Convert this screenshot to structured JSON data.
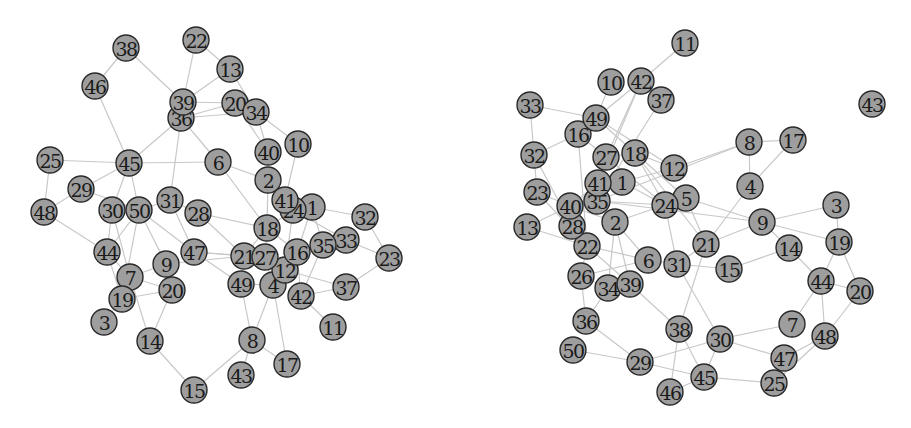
{
  "graphs": [
    {
      "id": "left-graph",
      "nodes": [
        "1",
        "2",
        "3",
        "4",
        "6",
        "7",
        "8",
        "9",
        "10",
        "11",
        "12",
        "13",
        "14",
        "15",
        "16",
        "17",
        "18",
        "19",
        "20",
        "21",
        "22",
        "23",
        "24",
        "25",
        "26",
        "27",
        "28",
        "29",
        "30",
        "31",
        "32",
        "33",
        "34",
        "35",
        "36",
        "37",
        "38",
        "39",
        "40",
        "41",
        "42",
        "43",
        "44",
        "45",
        "46",
        "47",
        "48",
        "49",
        "50"
      ],
      "edges": [
        [
          "38",
          "46"
        ],
        [
          "38",
          "39"
        ],
        [
          "46",
          "45"
        ],
        [
          "22",
          "39"
        ],
        [
          "22",
          "13"
        ],
        [
          "13",
          "39"
        ],
        [
          "13",
          "34"
        ],
        [
          "39",
          "20"
        ],
        [
          "36",
          "20"
        ],
        [
          "36",
          "34"
        ],
        [
          "36",
          "45"
        ],
        [
          "36",
          "6"
        ],
        [
          "36",
          "31"
        ],
        [
          "20",
          "40"
        ],
        [
          "34",
          "10"
        ],
        [
          "34",
          "40"
        ],
        [
          "40",
          "2"
        ],
        [
          "10",
          "41"
        ],
        [
          "6",
          "45"
        ],
        [
          "6",
          "2"
        ],
        [
          "6",
          "18"
        ],
        [
          "25",
          "45"
        ],
        [
          "25",
          "48"
        ],
        [
          "45",
          "29"
        ],
        [
          "45",
          "30"
        ],
        [
          "45",
          "50"
        ],
        [
          "29",
          "48"
        ],
        [
          "29",
          "50"
        ],
        [
          "48",
          "44"
        ],
        [
          "30",
          "44"
        ],
        [
          "30",
          "7"
        ],
        [
          "50",
          "44"
        ],
        [
          "50",
          "9"
        ],
        [
          "50",
          "47"
        ],
        [
          "50",
          "31"
        ],
        [
          "31",
          "28"
        ],
        [
          "31",
          "47"
        ],
        [
          "28",
          "18"
        ],
        [
          "28",
          "21"
        ],
        [
          "47",
          "21"
        ],
        [
          "47",
          "49"
        ],
        [
          "47",
          "27"
        ],
        [
          "44",
          "7"
        ],
        [
          "44",
          "19"
        ],
        [
          "7",
          "9"
        ],
        [
          "7",
          "20"
        ],
        [
          "7",
          "14"
        ],
        [
          "9",
          "20"
        ],
        [
          "9",
          "21"
        ],
        [
          "19",
          "3"
        ],
        [
          "19",
          "20"
        ],
        [
          "20",
          "14"
        ],
        [
          "14",
          "15"
        ],
        [
          "15",
          "8"
        ],
        [
          "2",
          "41"
        ],
        [
          "2",
          "18"
        ],
        [
          "41",
          "1"
        ],
        [
          "41",
          "24"
        ],
        [
          "1",
          "16"
        ],
        [
          "1",
          "35"
        ],
        [
          "1",
          "32"
        ],
        [
          "24",
          "18"
        ],
        [
          "24",
          "33"
        ],
        [
          "18",
          "21"
        ],
        [
          "18",
          "27"
        ],
        [
          "18",
          "16"
        ],
        [
          "27",
          "12"
        ],
        [
          "27",
          "4"
        ],
        [
          "21",
          "49"
        ],
        [
          "16",
          "12"
        ],
        [
          "16",
          "42"
        ],
        [
          "35",
          "33"
        ],
        [
          "35",
          "42"
        ],
        [
          "33",
          "23"
        ],
        [
          "32",
          "23"
        ],
        [
          "23",
          "37"
        ],
        [
          "37",
          "42"
        ],
        [
          "37",
          "12"
        ],
        [
          "12",
          "4"
        ],
        [
          "42",
          "11"
        ],
        [
          "4",
          "49"
        ],
        [
          "4",
          "8"
        ],
        [
          "4",
          "17"
        ],
        [
          "49",
          "8"
        ],
        [
          "8",
          "43"
        ],
        [
          "8",
          "17"
        ],
        [
          "24",
          "12"
        ],
        [
          "19",
          "50"
        ]
      ]
    },
    {
      "id": "right-graph",
      "nodes": [
        "1",
        "2",
        "3",
        "4",
        "5",
        "6",
        "7",
        "8",
        "9",
        "10",
        "11",
        "12",
        "13",
        "14",
        "15",
        "16",
        "17",
        "18",
        "19",
        "20",
        "21",
        "22",
        "23",
        "24",
        "25",
        "26",
        "27",
        "28",
        "29",
        "30",
        "31",
        "32",
        "33",
        "34",
        "35",
        "36",
        "37",
        "38",
        "39",
        "40",
        "41",
        "42",
        "43",
        "44",
        "45",
        "46",
        "47",
        "48",
        "49",
        "50"
      ],
      "edges": [
        [
          "11",
          "42"
        ],
        [
          "10",
          "49"
        ],
        [
          "42",
          "37"
        ],
        [
          "42",
          "49"
        ],
        [
          "42",
          "27"
        ],
        [
          "42",
          "41"
        ],
        [
          "37",
          "35"
        ],
        [
          "33",
          "49"
        ],
        [
          "33",
          "32"
        ],
        [
          "49",
          "16"
        ],
        [
          "49",
          "18"
        ],
        [
          "49",
          "12"
        ],
        [
          "16",
          "32"
        ],
        [
          "16",
          "27"
        ],
        [
          "16",
          "22"
        ],
        [
          "32",
          "23"
        ],
        [
          "32",
          "28"
        ],
        [
          "27",
          "18"
        ],
        [
          "27",
          "41"
        ],
        [
          "27",
          "24"
        ],
        [
          "18",
          "12"
        ],
        [
          "18",
          "24"
        ],
        [
          "18",
          "5"
        ],
        [
          "18",
          "21"
        ],
        [
          "12",
          "8"
        ],
        [
          "12",
          "1"
        ],
        [
          "8",
          "17"
        ],
        [
          "8",
          "4"
        ],
        [
          "17",
          "4"
        ],
        [
          "8",
          "35"
        ],
        [
          "4",
          "21"
        ],
        [
          "41",
          "1"
        ],
        [
          "41",
          "35"
        ],
        [
          "41",
          "40"
        ],
        [
          "1",
          "24"
        ],
        [
          "23",
          "40"
        ],
        [
          "23",
          "22"
        ],
        [
          "13",
          "40"
        ],
        [
          "13",
          "22"
        ],
        [
          "40",
          "28"
        ],
        [
          "40",
          "2"
        ],
        [
          "35",
          "24"
        ],
        [
          "35",
          "9"
        ],
        [
          "2",
          "24"
        ],
        [
          "2",
          "6"
        ],
        [
          "2",
          "34"
        ],
        [
          "2",
          "39"
        ],
        [
          "28",
          "22"
        ],
        [
          "22",
          "6"
        ],
        [
          "22",
          "26"
        ],
        [
          "22",
          "39"
        ],
        [
          "24",
          "31"
        ],
        [
          "24",
          "5"
        ],
        [
          "5",
          "9"
        ],
        [
          "5",
          "21"
        ],
        [
          "6",
          "31"
        ],
        [
          "6",
          "26"
        ],
        [
          "31",
          "21"
        ],
        [
          "31",
          "15"
        ],
        [
          "31",
          "30"
        ],
        [
          "21",
          "9"
        ],
        [
          "21",
          "38"
        ],
        [
          "9",
          "3"
        ],
        [
          "9",
          "14"
        ],
        [
          "9",
          "19"
        ],
        [
          "3",
          "19"
        ],
        [
          "14",
          "15"
        ],
        [
          "14",
          "44"
        ],
        [
          "19",
          "44"
        ],
        [
          "19",
          "20"
        ],
        [
          "44",
          "20"
        ],
        [
          "44",
          "7"
        ],
        [
          "44",
          "48"
        ],
        [
          "20",
          "48"
        ],
        [
          "48",
          "47"
        ],
        [
          "48",
          "25"
        ],
        [
          "7",
          "30"
        ],
        [
          "30",
          "47"
        ],
        [
          "30",
          "45"
        ],
        [
          "30",
          "29"
        ],
        [
          "47",
          "25"
        ],
        [
          "45",
          "25"
        ],
        [
          "45",
          "38"
        ],
        [
          "45",
          "29"
        ],
        [
          "38",
          "46"
        ],
        [
          "38",
          "39"
        ],
        [
          "46",
          "45"
        ],
        [
          "29",
          "36"
        ],
        [
          "29",
          "50"
        ],
        [
          "36",
          "26"
        ],
        [
          "36",
          "34"
        ],
        [
          "26",
          "34"
        ]
      ]
    }
  ]
}
